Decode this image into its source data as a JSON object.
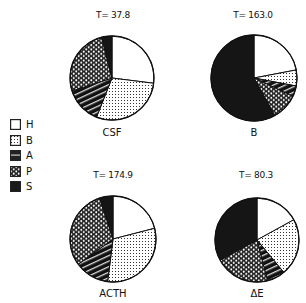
{
  "chart_data": [
    {
      "type": "pie",
      "title": "T= 37.8",
      "label": "CSF",
      "total": 37.8,
      "categories": [
        "H",
        "B",
        "A",
        "P",
        "S"
      ],
      "values": [
        27,
        29,
        14,
        26,
        4
      ],
      "units": "percent (estimated)"
    },
    {
      "type": "pie",
      "title": "T= 163.0",
      "label": "B",
      "total": 163.0,
      "categories": [
        "H",
        "B",
        "A",
        "P",
        "S"
      ],
      "values": [
        22,
        6,
        4,
        10,
        58
      ],
      "units": "percent (estimated)"
    },
    {
      "type": "pie",
      "title": "T= 174.9",
      "label": "ACTH",
      "total": 174.9,
      "categories": [
        "H",
        "B",
        "A",
        "P",
        "S"
      ],
      "values": [
        21,
        31,
        13,
        30,
        5
      ],
      "units": "percent (estimated)"
    },
    {
      "type": "pie",
      "title": "T= 80.3",
      "label": "ΔE",
      "total": 80.3,
      "categories": [
        "H",
        "B",
        "A",
        "P",
        "S"
      ],
      "values": [
        17,
        22,
        7,
        21,
        33
      ],
      "units": "percent (estimated)"
    }
  ],
  "legend": {
    "position": "left",
    "items": [
      {
        "key": "H",
        "label": "H",
        "pattern": "white"
      },
      {
        "key": "B",
        "label": "B",
        "pattern": "fine-dots"
      },
      {
        "key": "A",
        "label": "A",
        "pattern": "horizontal-diagonal-stripes"
      },
      {
        "key": "P",
        "label": "P",
        "pattern": "hexagon-mesh"
      },
      {
        "key": "S",
        "label": "S",
        "pattern": "solid-black"
      }
    ]
  },
  "panels": [
    {
      "title": "T= 37.8",
      "label": "CSF"
    },
    {
      "title": "T= 163.0",
      "label": "B"
    },
    {
      "title": "T= 174.9",
      "label": "ACTH"
    },
    {
      "title": "T= 80.3",
      "label": "ΔE"
    }
  ],
  "colors": {
    "ink": "#111111",
    "background": "#ffffff"
  }
}
